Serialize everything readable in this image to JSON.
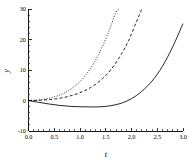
{
  "chart_data": {
    "type": "line",
    "title": "",
    "xlabel": "t",
    "ylabel": "y",
    "xlim": [
      0.0,
      3.0
    ],
    "ylim": [
      -10,
      30
    ],
    "grid": false,
    "legend": "none",
    "x_ticks": [
      "0.0",
      "0.5",
      "1.0",
      "1.5",
      "2.0",
      "2.5",
      "3.0"
    ],
    "x_tick_values": [
      0.0,
      0.5,
      1.0,
      1.5,
      2.0,
      2.5,
      3.0
    ],
    "x_minor_step": 0.1,
    "y_ticks": [
      "30",
      "20",
      "10",
      "0",
      "-10"
    ],
    "y_tick_values": [
      30,
      20,
      10,
      0,
      -10
    ],
    "y_minor_step": 2,
    "series": [
      {
        "name": "dotted-curve",
        "style": "dotted",
        "color": "#000000",
        "x": [
          0.0,
          0.15,
          0.3,
          0.45,
          0.6,
          0.75,
          0.9,
          1.05,
          1.2,
          1.35,
          1.5,
          1.6,
          1.7,
          1.78
        ],
        "y": [
          0.0,
          0.12,
          0.42,
          0.95,
          1.75,
          2.95,
          4.7,
          7.1,
          10.4,
          14.7,
          20.2,
          24.4,
          29.0,
          30.0
        ]
      },
      {
        "name": "dashed-curve",
        "style": "dashed",
        "color": "#000000",
        "x": [
          0.0,
          0.2,
          0.4,
          0.6,
          0.8,
          1.0,
          1.2,
          1.4,
          1.6,
          1.8,
          1.95,
          2.1,
          2.2
        ],
        "y": [
          0.0,
          0.08,
          0.3,
          0.72,
          1.45,
          2.55,
          4.2,
          6.6,
          10.1,
          15.1,
          19.9,
          26.0,
          30.0
        ]
      },
      {
        "name": "solid-curve",
        "style": "solid",
        "color": "#000000",
        "x": [
          0.0,
          0.2,
          0.4,
          0.6,
          0.8,
          1.0,
          1.2,
          1.4,
          1.6,
          1.8,
          2.0,
          2.2,
          2.4,
          2.6,
          2.8,
          3.0
        ],
        "y": [
          0.0,
          -0.6,
          -1.15,
          -1.6,
          -1.9,
          -2.05,
          -2.1,
          -2.05,
          -1.7,
          -0.9,
          0.6,
          3.0,
          6.4,
          11.2,
          17.6,
          25.2
        ]
      }
    ]
  }
}
